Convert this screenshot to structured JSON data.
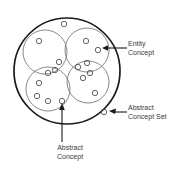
{
  "diagram": {
    "colors": {
      "outer_circle_stroke": "#1a1a1a",
      "abstract_concept_stroke": "#6b6b6b",
      "entity_concept_stroke": "#4a4a4a",
      "text": "#3a3a3a",
      "arrow": "#1a1a1a",
      "background": "#ffffff"
    },
    "annotations": [
      {
        "id": "entity-concept",
        "lines": [
          "Entity",
          "Concept"
        ],
        "points_to": "entity-concept-circle"
      },
      {
        "id": "abstract-concept-set",
        "lines": [
          "Abstract",
          "Concept Set"
        ],
        "points_to": "outer-circle"
      },
      {
        "id": "abstract-concept",
        "lines": [
          "Abstract",
          "Concept"
        ],
        "points_to": "abstract-concept-circle"
      }
    ],
    "outer_circle": {
      "name": "abstract-concept-set",
      "cx": 67,
      "cy": 71,
      "r": 53,
      "stroke_width": 1.6
    },
    "abstract_concepts": [
      {
        "name": "abstract-concept-top-left",
        "cx": 45,
        "cy": 52,
        "r": 22
      },
      {
        "name": "abstract-concept-top-right",
        "cx": 87,
        "cy": 50,
        "r": 22
      },
      {
        "name": "abstract-concept-bottom-left",
        "cx": 48,
        "cy": 89,
        "r": 22
      },
      {
        "name": "abstract-concept-bottom-right",
        "cx": 88,
        "cy": 82,
        "r": 21
      }
    ],
    "entity_concepts": [
      {
        "name": "entity-concept-outer-top",
        "cx": 64,
        "cy": 24,
        "r": 2.6
      },
      {
        "name": "entity-concept-tl-1",
        "cx": 39,
        "cy": 41,
        "r": 2.6
      },
      {
        "name": "entity-concept-tr-1",
        "cx": 86,
        "cy": 41,
        "r": 2.6
      },
      {
        "name": "entity-concept-tr-2",
        "cx": 98,
        "cy": 50,
        "r": 2.6
      },
      {
        "name": "entity-concept-mid-1",
        "cx": 59,
        "cy": 62,
        "r": 2.6
      },
      {
        "name": "entity-concept-mid-2",
        "cx": 55,
        "cy": 70,
        "r": 2.6
      },
      {
        "name": "entity-concept-mid-3",
        "cx": 48,
        "cy": 73,
        "r": 2.6
      },
      {
        "name": "entity-concept-mid-4",
        "cx": 78,
        "cy": 67,
        "r": 2.6
      },
      {
        "name": "entity-concept-mid-5",
        "cx": 87,
        "cy": 63,
        "r": 2.6
      },
      {
        "name": "entity-concept-mid-6",
        "cx": 90,
        "cy": 73,
        "r": 2.6
      },
      {
        "name": "entity-concept-mid-7",
        "cx": 83,
        "cy": 78,
        "r": 2.6
      },
      {
        "name": "entity-concept-bl-1",
        "cx": 39,
        "cy": 83,
        "r": 2.6
      },
      {
        "name": "entity-concept-bl-2",
        "cx": 37,
        "cy": 96,
        "r": 2.6
      },
      {
        "name": "entity-concept-bl-3",
        "cx": 48,
        "cy": 101,
        "r": 2.6
      },
      {
        "name": "entity-concept-bl-4",
        "cx": 62,
        "cy": 101,
        "r": 2.6
      },
      {
        "name": "entity-concept-outer-right",
        "cx": 95,
        "cy": 93,
        "r": 2.6
      },
      {
        "name": "entity-concept-outer-br",
        "cx": 104,
        "cy": 112,
        "r": 2.6
      }
    ],
    "arrows": [
      {
        "name": "arrow-entity-concept",
        "path": "M 126 48 L 103 48",
        "head_at": [
          103,
          48
        ]
      },
      {
        "name": "arrow-abstract-concept-set",
        "path": "M 126 112 L 110 112",
        "head_at": [
          110,
          112
        ]
      },
      {
        "name": "arrow-abstract-concept",
        "path": "M 62 142 L 62 104",
        "head_at": [
          62,
          104
        ]
      }
    ]
  }
}
